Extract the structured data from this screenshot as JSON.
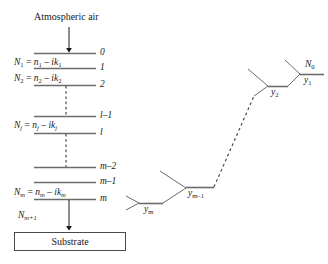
{
  "figure": {
    "title_top": "Atmospheric air",
    "substrate_label": "Substrate",
    "incident_medium_formula_prefix": "N",
    "layers": [
      {
        "boundary_label": "0"
      },
      {
        "boundary_label": "1"
      },
      {
        "boundary_label": "2"
      },
      {
        "boundary_label": "l–1"
      },
      {
        "boundary_label": "l"
      },
      {
        "boundary_label": "m–2"
      },
      {
        "boundary_label": "m–1"
      },
      {
        "boundary_label": "m"
      }
    ],
    "formulas": [
      {
        "id": "N1",
        "text": "N₁ = n₁ – ik₁",
        "base": "N",
        "sub": "1",
        "rhs_base1": "n",
        "rhs_sub1": "1",
        "rhs_base2": "k",
        "rhs_sub2": "1"
      },
      {
        "id": "N2",
        "text": "N₂ = n₂ – ik₂",
        "base": "N",
        "sub": "2",
        "rhs_base1": "n",
        "rhs_sub1": "2",
        "rhs_base2": "k",
        "rhs_sub2": "2"
      },
      {
        "id": "Nj",
        "text": "Nⱼ = nⱼ – ikⱼ",
        "base": "N",
        "sub": "j",
        "rhs_base1": "n",
        "rhs_sub1": "j",
        "rhs_base2": "k",
        "rhs_sub2": "j"
      },
      {
        "id": "Nm",
        "text": "Nₘ = nₘ – ikₘ",
        "base": "N",
        "sub": "m",
        "rhs_base1": "n",
        "rhs_sub1": "m",
        "rhs_base2": "k",
        "rhs_sub2": "m"
      }
    ],
    "substrate_index": {
      "base": "N",
      "sub": "m+1"
    },
    "admittance_labels": [
      {
        "id": "N0",
        "base": "N",
        "sub": "0"
      },
      {
        "id": "y1",
        "base": "y",
        "sub": "1"
      },
      {
        "id": "y2",
        "base": "y",
        "sub": "2"
      },
      {
        "id": "ym1",
        "base": "y",
        "sub": "m–1"
      },
      {
        "id": "ym",
        "base": "y",
        "sub": "m"
      }
    ],
    "colors": {
      "line": "#6b6b6b",
      "dashed": "#4a4a4a",
      "arrow": "#1a1a1a",
      "box_border": "#4a4a4a",
      "text": "#1a1a1a",
      "background": "#ffffff"
    }
  }
}
